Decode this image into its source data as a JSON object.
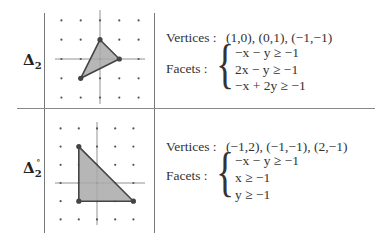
{
  "table": {
    "rows": [
      {
        "label": "Δ",
        "subscript": "2",
        "superscript": "",
        "vertices_label": "Vertices :",
        "vertices": "(1,0),  (0,1),  (−1,−1)",
        "facets_label": "Facets :",
        "facets": [
          "−x − y ≥ −1",
          "2x − y ≥ −1",
          "−x + 2y ≥ −1"
        ],
        "lattice": {
          "cols": [
            -2,
            -1,
            0,
            1,
            2
          ],
          "rows": [
            2,
            1,
            0,
            -1,
            -2
          ]
        },
        "polygon": [
          [
            1,
            0
          ],
          [
            0,
            1
          ],
          [
            -1,
            -1
          ]
        ]
      },
      {
        "label": "Δ",
        "subscript": "2",
        "superscript": "∘",
        "vertices_label": "Vertices :",
        "vertices": "(−1,2),  (−1,−1),  (2,−1)",
        "facets_label": "Facets :",
        "facets": [
          "−x − y ≥ −1",
          "x ≥ −1",
          "y ≥ −1"
        ],
        "lattice": {
          "cols": [
            -2,
            -1,
            0,
            1,
            2
          ],
          "rows": [
            3,
            2,
            1,
            0,
            -1,
            -2
          ]
        },
        "polygon": [
          [
            -1,
            2
          ],
          [
            -1,
            -1
          ],
          [
            2,
            -1
          ]
        ]
      }
    ]
  },
  "colors": {
    "fill": "#a9a9a9",
    "stroke": "#444444",
    "grid": "#777777",
    "dot": "#555555"
  }
}
